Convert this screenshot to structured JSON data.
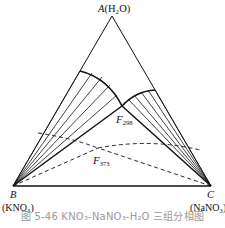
{
  "figure": {
    "caption": "图 5-46   KNO₃-NaNO₃-H₂O 三组分相图",
    "vertices": {
      "A": {
        "letter": "A",
        "compound": "(H₂O)",
        "x": 112,
        "y": 16
      },
      "B": {
        "letter": "B",
        "compound": "(KNO₃)",
        "x": 13,
        "y": 186
      },
      "C": {
        "letter": "C",
        "compound": "(NaNO₃)",
        "x": 211,
        "y": 186
      }
    },
    "points": {
      "F298": {
        "letter": "F",
        "sub": "298",
        "x": 122,
        "y": 106
      },
      "F373": {
        "letter": "F",
        "sub": "373",
        "x": 98,
        "y": 148
      }
    },
    "line_color": "#111111",
    "caption_color": "#9a9a9a"
  }
}
